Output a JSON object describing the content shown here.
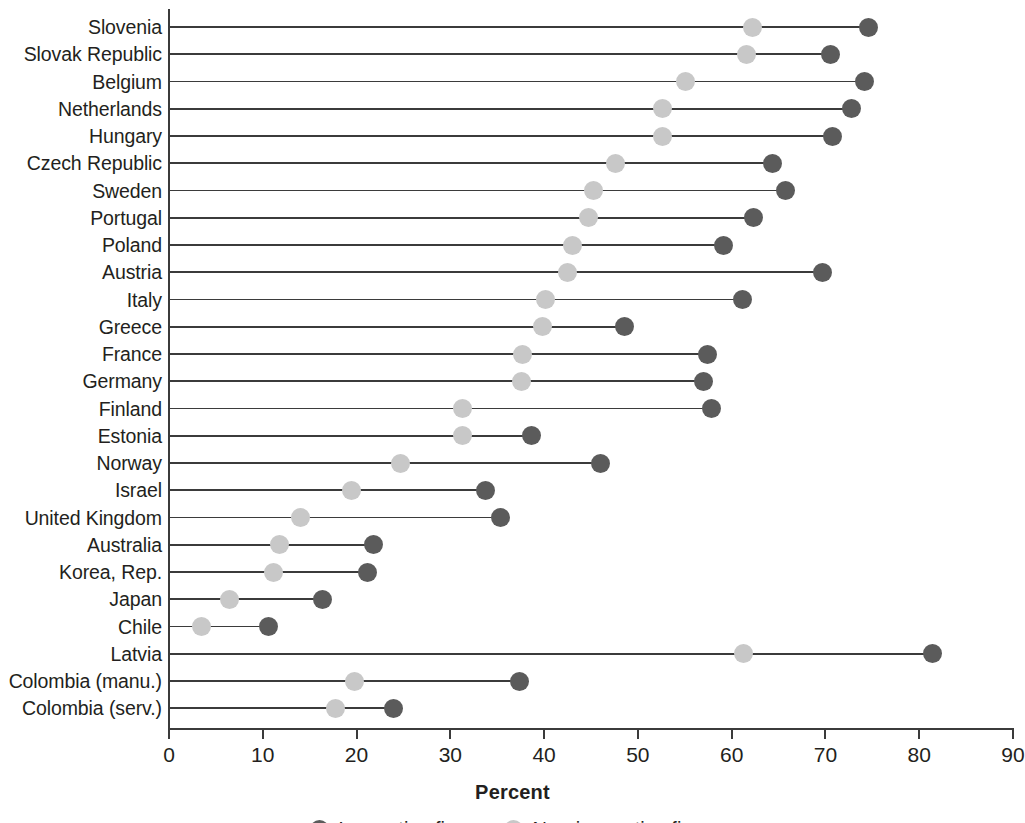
{
  "chart_data": {
    "type": "scatter",
    "subtype": "dumbbell",
    "title": "",
    "xlabel": "Percent",
    "ylabel": "",
    "xlim": [
      0,
      90
    ],
    "xticks": [
      0,
      10,
      20,
      30,
      40,
      50,
      60,
      70,
      80,
      90
    ],
    "grid": false,
    "legend_position": "bottom",
    "series": [
      {
        "name": "Innovative firms",
        "color": "#5b5b5b",
        "values": [
          74.6,
          70.5,
          74.2,
          72.8,
          70.8,
          64.4,
          65.7,
          62.3,
          59.1,
          69.7,
          61.2,
          48.6,
          57.4,
          57.0,
          57.9,
          38.7,
          46.0,
          33.7,
          35.3,
          21.8,
          21.2,
          16.4,
          10.6,
          81.4,
          37.4,
          23.9
        ]
      },
      {
        "name": "Non-innovative firms",
        "color": "#c8c8c8",
        "values": [
          62.2,
          61.6,
          55.1,
          52.6,
          52.6,
          47.6,
          45.3,
          44.7,
          43.0,
          42.5,
          40.1,
          39.8,
          37.7,
          37.6,
          31.3,
          31.3,
          24.7,
          19.5,
          14.0,
          11.8,
          11.1,
          6.5,
          3.5,
          61.3,
          19.8,
          17.8
        ]
      }
    ],
    "categories": [
      "Slovenia",
      "Slovak Republic",
      "Belgium",
      "Netherlands",
      "Hungary",
      "Czech Republic",
      "Sweden",
      "Portugal",
      "Poland",
      "Austria",
      "Italy",
      "Greece",
      "France",
      "Germany",
      "Finland",
      "Estonia",
      "Norway",
      "Israel",
      "United Kingdom",
      "Australia",
      "Korea, Rep.",
      "Japan",
      "Chile",
      "Latvia",
      "Colombia (manu.)",
      "Colombia (serv.)"
    ]
  },
  "legend": {
    "items": [
      {
        "label": "Innovative firms",
        "color": "#5b5b5b"
      },
      {
        "label": "Non-innovative firms",
        "color": "#c8c8c8"
      }
    ]
  },
  "axis": {
    "x_title": "Percent",
    "tick_labels": [
      "0",
      "10",
      "20",
      "30",
      "40",
      "50",
      "60",
      "70",
      "80",
      "90"
    ]
  }
}
